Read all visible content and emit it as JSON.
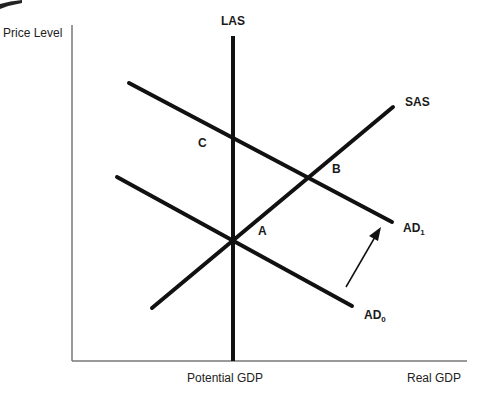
{
  "diagram": {
    "title": "",
    "axes": {
      "y_label": "Price Level",
      "x_label": "Real GDP",
      "x_tick_label": "Potential GDP"
    },
    "curves": {
      "las": {
        "label": "LAS"
      },
      "sas": {
        "label": "SAS"
      },
      "ad1": {
        "label": "AD",
        "subscript": "1"
      },
      "ad0": {
        "label": "AD",
        "subscript": "0"
      }
    },
    "points": {
      "a": "A",
      "b": "B",
      "c": "C"
    },
    "shift_arrow": {
      "from": "AD0",
      "to": "AD1",
      "direction": "right/up"
    },
    "colors": {
      "line": "#111111",
      "axis": "#777777",
      "background": "#ffffff"
    }
  }
}
